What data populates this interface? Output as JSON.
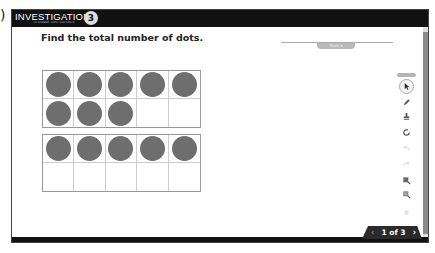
{
  "app": {
    "logo_text": "INVESTIGATIONS",
    "logo_subtitle": "IN NUMBER, DATA, AND SPACE",
    "logo_badge": "3",
    "edge_glyph": ")"
  },
  "question": {
    "prompt": "Find the total number of dots."
  },
  "tools_panel": {
    "tab_label": "Tools",
    "items": [
      {
        "name": "select-pointer",
        "active": true
      },
      {
        "name": "pen"
      },
      {
        "name": "eraser-stamp"
      },
      {
        "name": "rotate"
      },
      {
        "name": "undo"
      },
      {
        "name": "redo"
      },
      {
        "name": "zoom-in"
      },
      {
        "name": "zoom-out"
      },
      {
        "name": "clear"
      }
    ]
  },
  "ten_frames": [
    {
      "filled": 8,
      "total": 10
    },
    {
      "filled": 5,
      "total": 10
    }
  ],
  "pagination": {
    "label": "1 of 3",
    "prev": "‹",
    "next": "›",
    "current": 1,
    "total": 3
  },
  "colors": {
    "dot": "#6e6e6e",
    "titlebar": "#111111",
    "scrollbar": "#8a8a8a"
  }
}
